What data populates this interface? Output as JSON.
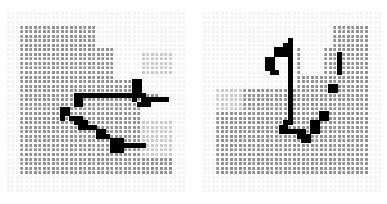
{
  "figure": {
    "title": "",
    "background_color": "#ffffff",
    "panel_count": 2,
    "panel_gap_px": 16
  },
  "legend": {
    "free_cell_color": "#8c8c8c",
    "light_cell_color": "#d9d9d9",
    "white_cell_color": "#f7f7f7",
    "path_cell_color": "#000000",
    "grid_line_color": "#ffffff",
    "border_cell_color": "#c4c4c4"
  },
  "chart_data": {
    "type": "heatmap",
    "title": "",
    "subtitle": "",
    "xlabel": "",
    "ylabel": "",
    "grid": true,
    "legend_position": "none",
    "cols": 40,
    "rows": 40,
    "cell_px": 4.5,
    "value_map": {
      "0": "#909090",
      "1": "#c9c9c9",
      "2": "#f2f2f2",
      "3": "#000000",
      "4": "#b4b4b4"
    },
    "panels": [
      {
        "name": "left-occupancy-grid",
        "label": "",
        "base_value": 0,
        "border_ring_value": 2,
        "light_regions": [
          {
            "col0": 24,
            "row0": 0,
            "col1": 39,
            "row1": 14,
            "value": 2
          },
          {
            "col0": 20,
            "row0": 0,
            "col1": 24,
            "row1": 7,
            "value": 2
          },
          {
            "col0": 30,
            "row0": 9,
            "col1": 36,
            "row1": 13,
            "value": 1
          },
          {
            "col0": 28,
            "row0": 14,
            "col1": 39,
            "row1": 17,
            "value": 2
          },
          {
            "col0": 34,
            "row0": 17,
            "col1": 39,
            "row1": 23,
            "value": 2
          },
          {
            "col0": 30,
            "row0": 20,
            "col1": 34,
            "row1": 23,
            "value": 2
          },
          {
            "col0": 30,
            "row0": 24,
            "col1": 39,
            "row1": 31,
            "value": 1
          },
          {
            "col0": 0,
            "row0": 0,
            "col1": 39,
            "row1": 2,
            "value": 2
          },
          {
            "col0": 0,
            "row0": 36,
            "col1": 39,
            "row1": 39,
            "value": 2
          },
          {
            "col0": 0,
            "row0": 0,
            "col1": 2,
            "row1": 39,
            "value": 2
          },
          {
            "col0": 37,
            "row0": 0,
            "col1": 39,
            "row1": 39,
            "value": 2
          }
        ],
        "path_cells": [
          [
            15,
            18
          ],
          [
            16,
            18
          ],
          [
            17,
            18
          ],
          [
            18,
            18
          ],
          [
            19,
            18
          ],
          [
            20,
            18
          ],
          [
            21,
            18
          ],
          [
            22,
            18
          ],
          [
            23,
            18
          ],
          [
            24,
            18
          ],
          [
            25,
            18
          ],
          [
            26,
            18
          ],
          [
            27,
            18
          ],
          [
            28,
            17
          ],
          [
            28,
            16
          ],
          [
            28,
            15
          ],
          [
            29,
            15
          ],
          [
            29,
            16
          ],
          [
            29,
            17
          ],
          [
            29,
            18
          ],
          [
            30,
            18
          ],
          [
            30,
            19
          ],
          [
            31,
            19
          ],
          [
            32,
            19
          ],
          [
            33,
            19
          ],
          [
            34,
            19
          ],
          [
            35,
            19
          ],
          [
            30,
            20
          ],
          [
            31,
            20
          ],
          [
            29,
            20
          ],
          [
            28,
            19
          ],
          [
            28,
            18
          ],
          [
            15,
            19
          ],
          [
            15,
            20
          ],
          [
            16,
            19
          ],
          [
            16,
            20
          ],
          [
            12,
            21
          ],
          [
            13,
            21
          ],
          [
            12,
            22
          ],
          [
            13,
            22
          ],
          [
            12,
            23
          ],
          [
            14,
            23
          ],
          [
            15,
            23
          ],
          [
            16,
            23
          ],
          [
            16,
            24
          ],
          [
            17,
            24
          ],
          [
            15,
            24
          ],
          [
            16,
            25
          ],
          [
            17,
            25
          ],
          [
            18,
            25
          ],
          [
            19,
            25
          ],
          [
            20,
            26
          ],
          [
            21,
            26
          ],
          [
            20,
            27
          ],
          [
            21,
            27
          ],
          [
            22,
            27
          ],
          [
            23,
            28
          ],
          [
            24,
            28
          ],
          [
            25,
            28
          ],
          [
            23,
            29
          ],
          [
            24,
            29
          ],
          [
            25,
            29
          ],
          [
            26,
            29
          ],
          [
            27,
            29
          ],
          [
            28,
            29
          ],
          [
            29,
            29
          ],
          [
            30,
            29
          ],
          [
            23,
            30
          ],
          [
            24,
            30
          ],
          [
            25,
            30
          ]
        ],
        "path_cell_count": 72
      },
      {
        "name": "right-occupancy-grid",
        "label": "",
        "base_value": 0,
        "border_ring_value": 2,
        "light_regions": [
          {
            "col0": 0,
            "row0": 0,
            "col1": 20,
            "row1": 16,
            "value": 2
          },
          {
            "col0": 20,
            "row0": 0,
            "col1": 28,
            "row1": 7,
            "value": 2
          },
          {
            "col0": 22,
            "row0": 7,
            "col1": 26,
            "row1": 13,
            "value": 2
          },
          {
            "col0": 0,
            "row0": 17,
            "col1": 8,
            "row1": 21,
            "value": 1
          },
          {
            "col0": 0,
            "row0": 0,
            "col1": 39,
            "row1": 2,
            "value": 2
          },
          {
            "col0": 0,
            "row0": 36,
            "col1": 39,
            "row1": 39,
            "value": 2
          },
          {
            "col0": 0,
            "row0": 0,
            "col1": 2,
            "row1": 39,
            "value": 2
          },
          {
            "col0": 37,
            "row0": 0,
            "col1": 39,
            "row1": 39,
            "value": 2
          }
        ],
        "path_cells": [
          [
            19,
            6
          ],
          [
            19,
            7
          ],
          [
            19,
            8
          ],
          [
            19,
            9
          ],
          [
            19,
            10
          ],
          [
            19,
            11
          ],
          [
            19,
            12
          ],
          [
            19,
            13
          ],
          [
            19,
            14
          ],
          [
            19,
            15
          ],
          [
            19,
            16
          ],
          [
            19,
            17
          ],
          [
            19,
            18
          ],
          [
            19,
            19
          ],
          [
            19,
            20
          ],
          [
            19,
            21
          ],
          [
            19,
            22
          ],
          [
            19,
            23
          ],
          [
            18,
            24
          ],
          [
            19,
            24
          ],
          [
            17,
            25
          ],
          [
            18,
            25
          ],
          [
            17,
            26
          ],
          [
            18,
            26
          ],
          [
            19,
            26
          ],
          [
            20,
            26
          ],
          [
            21,
            26
          ],
          [
            22,
            26
          ],
          [
            21,
            27
          ],
          [
            22,
            27
          ],
          [
            23,
            27
          ],
          [
            22,
            28
          ],
          [
            23,
            28
          ],
          [
            16,
            8
          ],
          [
            17,
            8
          ],
          [
            16,
            9
          ],
          [
            17,
            9
          ],
          [
            18,
            9
          ],
          [
            18,
            8
          ],
          [
            18,
            7
          ],
          [
            14,
            10
          ],
          [
            15,
            10
          ],
          [
            14,
            11
          ],
          [
            15,
            11
          ],
          [
            14,
            12
          ],
          [
            15,
            12
          ],
          [
            15,
            13
          ],
          [
            16,
            13
          ],
          [
            24,
            25
          ],
          [
            25,
            25
          ],
          [
            24,
            24
          ],
          [
            25,
            24
          ],
          [
            26,
            23
          ],
          [
            27,
            23
          ],
          [
            26,
            22
          ],
          [
            27,
            22
          ],
          [
            28,
            17
          ],
          [
            29,
            17
          ],
          [
            28,
            16
          ],
          [
            29,
            16
          ],
          [
            30,
            13
          ],
          [
            30,
            12
          ],
          [
            30,
            11
          ],
          [
            30,
            10
          ],
          [
            30,
            9
          ],
          [
            24,
            26
          ],
          [
            25,
            26
          ]
        ],
        "path_cell_count": 68
      }
    ]
  }
}
